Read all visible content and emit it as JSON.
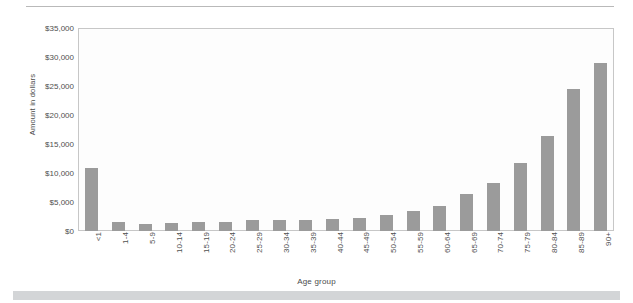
{
  "chart_data": {
    "type": "bar",
    "title": "",
    "xlabel": "Age group",
    "ylabel": "Amount in dollars",
    "ylim": [
      0,
      35000
    ],
    "ytick_step": 5000,
    "ytick_labels": [
      "$0",
      "$5,000",
      "$10,000",
      "$15,000",
      "$20,000",
      "$25,000",
      "$30,000",
      "$35,000"
    ],
    "ytick_values": [
      0,
      5000,
      10000,
      15000,
      20000,
      25000,
      30000,
      35000
    ],
    "grid": false,
    "legend": null,
    "bar_color": "#9b9b9b",
    "categories": [
      "<1",
      "1-4",
      "5-9",
      "10-14",
      "15-19",
      "20-24",
      "25-29",
      "30-34",
      "35-39",
      "40-44",
      "45-49",
      "50-54",
      "55-59",
      "60-64",
      "65-69",
      "70-74",
      "75-79",
      "80-84",
      "85-89",
      "90+"
    ],
    "values": [
      10900,
      1500,
      1200,
      1300,
      1500,
      1600,
      1900,
      1900,
      1900,
      2000,
      2300,
      2800,
      3500,
      4300,
      6300,
      8300,
      11700,
      16300,
      24400,
      29000
    ]
  },
  "page": {
    "top_rule_color": "#b9b9b9",
    "bottom_band_color": "#d3d5d7"
  }
}
